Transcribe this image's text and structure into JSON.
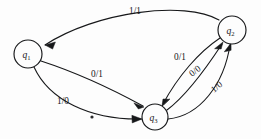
{
  "diagram": {
    "background_color": "#fdfdfd",
    "ink_color": "#17181a",
    "nodes": [
      {
        "id": "q1",
        "label": "q",
        "subscript": "1",
        "cx": 28,
        "cy": 54,
        "r": 14
      },
      {
        "id": "q2",
        "label": "q",
        "subscript": "2",
        "cx": 232,
        "cy": 30,
        "r": 14
      },
      {
        "id": "q3",
        "label": "q",
        "subscript": "3",
        "cx": 155,
        "cy": 117,
        "r": 13
      }
    ],
    "edges": [
      {
        "id": "e-q2-q1",
        "from": "q2",
        "to": "q1",
        "label": "1/1",
        "input": "1",
        "output": "1",
        "label_x": 129,
        "label_y": 14
      },
      {
        "id": "e-q1-q3-a",
        "from": "q1",
        "to": "q3",
        "label": "0/1",
        "input": "0",
        "output": "1",
        "label_x": 91,
        "label_y": 77
      },
      {
        "id": "e-q1-q3-b",
        "from": "q1",
        "to": "q3",
        "label": "1/0",
        "input": "1",
        "output": "0",
        "label_x": 57,
        "label_y": 104
      },
      {
        "id": "e-q2-q3",
        "from": "q2",
        "to": "q3",
        "label": "0/1",
        "input": "0",
        "output": "1",
        "label_x": 174,
        "label_y": 60
      },
      {
        "id": "e-q3-q2-a",
        "from": "q3",
        "to": "q2",
        "label": "0/0",
        "input": "0",
        "output": "0",
        "label_x": 192,
        "label_y": 77
      },
      {
        "id": "e-q3-q2-b",
        "from": "q3",
        "to": "q2",
        "label": "1/0",
        "input": "1",
        "output": "0",
        "label_x": 214,
        "label_y": 93
      }
    ],
    "artifacts": [
      {
        "id": "scan-speck",
        "x": 92,
        "y": 117,
        "r": 1.6
      }
    ]
  }
}
